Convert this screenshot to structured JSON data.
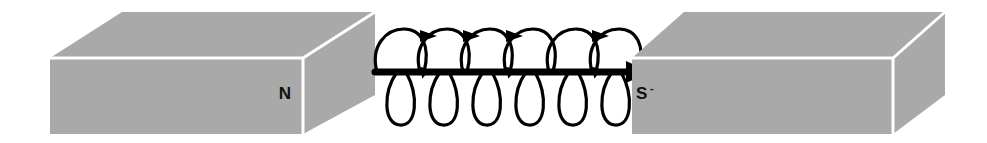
{
  "figure": {
    "background_color": "#ffffff"
  },
  "colors": {
    "magnet_face_gray": "#a9a9a9",
    "magnet_top_gray": "#a9a9a9",
    "magnet_side_gray": "#a9a9a9",
    "edge_highlight": "#ffffff",
    "field_line": "#000000",
    "label_color": "#101010"
  },
  "magnets": [
    {
      "id": "left-magnet",
      "pole_label": "N",
      "pole_mark": "",
      "label_x": 285,
      "label_y": 99,
      "front": {
        "x": 50,
        "y": 58,
        "width": 253,
        "height": 76
      },
      "depth_dx": 72,
      "depth_dy": -46
    },
    {
      "id": "right-magnet",
      "pole_label": "S",
      "pole_mark": "-",
      "label_x": 636,
      "label_y": 99,
      "front": {
        "x": 632,
        "y": 58,
        "width": 261,
        "height": 76
      },
      "depth_dx": 52,
      "depth_dy": -46
    }
  ],
  "field": {
    "id": "helix-field-line",
    "axis_y": 72,
    "axis_start_x": 375,
    "axis_end_x": 634,
    "loop_count": 6,
    "arrowhead_count": 4,
    "terminal_arrow": "right-pointing-triangle",
    "loop_width": 44,
    "loop_height": 92,
    "description": "Helical coil wound around a straight horizontal arrow pointing from N pole to S pole"
  }
}
